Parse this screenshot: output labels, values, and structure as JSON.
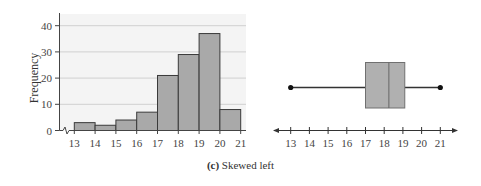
{
  "chart_data": [
    {
      "type": "bar",
      "subtype": "histogram",
      "title": "",
      "xlabel": "",
      "ylabel": "Frequency",
      "bins": [
        [
          13,
          14
        ],
        [
          14,
          15
        ],
        [
          15,
          16
        ],
        [
          16,
          17
        ],
        [
          17,
          18
        ],
        [
          18,
          19
        ],
        [
          19,
          20
        ],
        [
          20,
          21
        ]
      ],
      "categories": [
        "13-14",
        "14-15",
        "15-16",
        "16-17",
        "17-18",
        "18-19",
        "19-20",
        "20-21"
      ],
      "values": [
        3,
        2,
        4,
        7,
        21,
        29,
        37,
        8
      ],
      "x_ticks": [
        13,
        14,
        15,
        16,
        17,
        18,
        19,
        20,
        21
      ],
      "y_ticks": [
        0,
        10,
        20,
        30,
        40
      ],
      "xlim": [
        13,
        21
      ],
      "ylim": [
        0,
        40
      ],
      "grid": "horizontal",
      "axis_break": "x-axis break symbol between 0 and 13",
      "colors": {
        "bar_fill": "#a9a9a9",
        "bar_edge": "#3a3a3a",
        "plot_bg": "#f4f4f4",
        "grid": "#d0d0d0"
      }
    },
    {
      "type": "boxplot",
      "title": "",
      "xlabel": "",
      "min": 13,
      "q1": 17,
      "median": 18.25,
      "q3": 19.1,
      "max": 21,
      "x_ticks": [
        13,
        14,
        15,
        16,
        17,
        18,
        19,
        20,
        21
      ],
      "xlim": [
        12.2,
        21.9
      ],
      "axis_arrows": "both ends",
      "colors": {
        "box_fill": "#b0b0b0",
        "box_edge": "#6a6a6a",
        "whisker": "#333333"
      }
    }
  ],
  "caption": {
    "label": "(c)",
    "text": " Skewed left"
  }
}
